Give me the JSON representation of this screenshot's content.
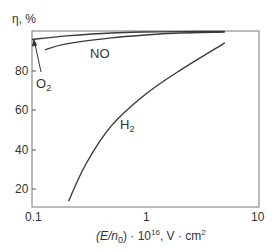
{
  "chart_data": {
    "type": "line",
    "title": "",
    "xlabel": "(E/n0) · 10^16, V · cm^2",
    "ylabel": "η, %",
    "xscale": "log",
    "xlim": [
      0.1,
      10
    ],
    "ylim": [
      11,
      100
    ],
    "x_ticks": [
      "0.1",
      "1",
      "10"
    ],
    "y_ticks": [
      "20",
      "40",
      "60",
      "80"
    ],
    "grid": false,
    "legend": "inline labels",
    "series": [
      {
        "name": "O2",
        "x": [
          0.1,
          0.2,
          0.5,
          1,
          2,
          5
        ],
        "y": [
          95.7,
          97.5,
          99.0,
          99.5,
          99.7,
          99.8
        ]
      },
      {
        "name": "NO",
        "x": [
          0.13,
          0.2,
          0.5,
          1,
          2,
          5
        ],
        "y": [
          90.5,
          93.5,
          96.5,
          98.0,
          99.0,
          99.5
        ]
      },
      {
        "name": "H2",
        "x": [
          0.21,
          0.3,
          0.5,
          1,
          2,
          5
        ],
        "y": [
          14,
          33,
          52,
          68,
          80,
          94
        ]
      }
    ],
    "annotations": [
      {
        "text": "O2",
        "arrow_to": [
          0.1,
          95.7
        ]
      }
    ]
  },
  "labels": {
    "ylabel_text": "η, %",
    "x_tick_0": "0.1",
    "x_tick_1": "1",
    "x_tick_2": "10",
    "y_tick_20": "20",
    "y_tick_40": "40",
    "y_tick_60": "60",
    "y_tick_80": "80",
    "series_no": "NO",
    "series_o2_main": "O",
    "series_o2_sub": "2",
    "series_h2_main": "H",
    "series_h2_sub": "2",
    "xlabel_part1": "(E/n",
    "xlabel_sub": "0",
    "xlabel_part2": ") · 10",
    "xlabel_sup1": "16",
    "xlabel_part3": ", V · cm",
    "xlabel_sup2": "2"
  },
  "colors": {
    "axis": "#555555",
    "curve": "#3a3a3a"
  }
}
